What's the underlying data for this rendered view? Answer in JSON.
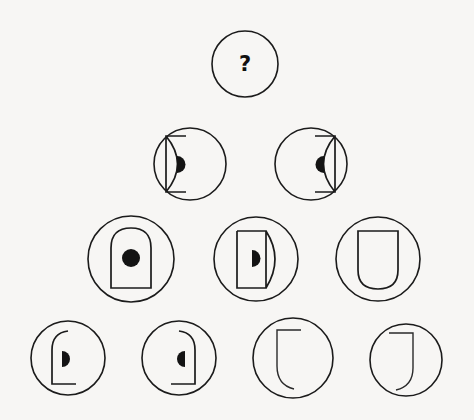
{
  "puzzle": {
    "type": "visual-analogy-pyramid",
    "background_color": "#f7f6f4",
    "ink_color": "#1b1b1b",
    "missing_cell_label": "?",
    "rows": [
      {
        "index": 1,
        "cells": [
          {
            "id": "r1c1",
            "state": "unknown",
            "label": "?",
            "shape": "question-mark",
            "dot": "none",
            "circle": {
              "cx": 245,
              "cy": 64,
              "r": 33
            }
          }
        ]
      },
      {
        "index": 2,
        "cells": [
          {
            "id": "r2c1",
            "state": "given",
            "label": "",
            "shape": "bracket-left-concave",
            "description": "flat top and bottom bars with vertical left edge and concave curved right side",
            "dot": "half-disk-right-facing",
            "circle": {
              "cx": 190,
              "cy": 164,
              "r": 36
            }
          },
          {
            "id": "r2c2",
            "state": "given",
            "label": "",
            "shape": "bracket-right-concave",
            "description": "mirrored bracket, vertical right edge and concave curved left side",
            "dot": "half-disk-left-facing",
            "circle": {
              "cx": 311,
              "cy": 164,
              "r": 36
            }
          }
        ]
      },
      {
        "index": 3,
        "cells": [
          {
            "id": "r3c1",
            "state": "given",
            "label": "",
            "shape": "arch-up",
            "description": "tombstone arch, rounded top and flat bottom",
            "dot": "full-circle",
            "circle": {
              "cx": 131,
              "cy": 259,
              "r": 43
            }
          },
          {
            "id": "r3c2",
            "state": "given",
            "label": "",
            "shape": "d-shape-right-convex",
            "description": "straight left edge with bulging convex right side",
            "dot": "half-disk-right-facing",
            "circle": {
              "cx": 256,
              "cy": 259,
              "r": 42
            }
          },
          {
            "id": "r3c3",
            "state": "given",
            "label": "",
            "shape": "arch-down",
            "description": "U shape, flat top and rounded bottom",
            "dot": "none",
            "circle": {
              "cx": 378,
              "cy": 259,
              "r": 42
            }
          }
        ]
      },
      {
        "index": 4,
        "cells": [
          {
            "id": "r4c1",
            "state": "given",
            "label": "",
            "shape": "hook-top-left-curved",
            "description": "curved top-left shoulder, vertical left edge, short foot at bottom",
            "dot": "half-disk-right-facing",
            "circle": {
              "cx": 68,
              "cy": 358,
              "r": 37
            }
          },
          {
            "id": "r4c2",
            "state": "given",
            "label": "",
            "shape": "hook-top-right-curved",
            "description": "mirrored hook, curved top-right shoulder, vertical right edge, foot at bottom-left",
            "dot": "half-disk-left-facing",
            "circle": {
              "cx": 179,
              "cy": 358,
              "r": 37
            }
          },
          {
            "id": "r4c3",
            "state": "given",
            "label": "",
            "shape": "hook-bottom-left-curved",
            "description": "horizontal top bar, vertical left edge, curved bottom tail",
            "dot": "none",
            "circle": {
              "cx": 293,
              "cy": 358,
              "r": 40
            }
          },
          {
            "id": "r4c4",
            "state": "given",
            "label": "",
            "shape": "hook-bottom-right-curved",
            "description": "horizontal top bar, vertical right edge, curved bottom tail mirrored",
            "dot": "none",
            "circle": {
              "cx": 406,
              "cy": 360,
              "r": 36
            }
          }
        ]
      }
    ]
  }
}
